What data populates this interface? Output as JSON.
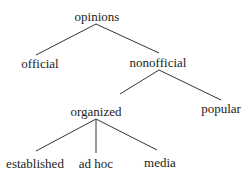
{
  "diagram": {
    "type": "tree",
    "colors": {
      "text": "#222222",
      "edge": "#333333",
      "background": "#ffffff"
    },
    "nodes": [
      {
        "id": "opinions",
        "label": "opinions",
        "x": 97,
        "y": 10
      },
      {
        "id": "official",
        "label": "official",
        "x": 40,
        "y": 57
      },
      {
        "id": "nonofficial",
        "label": "nonofficial",
        "x": 158,
        "y": 56
      },
      {
        "id": "organized",
        "label": "organized",
        "x": 96,
        "y": 105
      },
      {
        "id": "popular",
        "label": "popular",
        "x": 221,
        "y": 102
      },
      {
        "id": "established",
        "label": "established",
        "x": 35,
        "y": 157
      },
      {
        "id": "adhoc",
        "label": "ad hoc",
        "x": 96,
        "y": 157
      },
      {
        "id": "media",
        "label": "media",
        "x": 160,
        "y": 156
      }
    ],
    "edges": [
      {
        "from": "opinions",
        "to": "official",
        "x1": 96,
        "y1": 24,
        "x2": 36,
        "y2": 55
      },
      {
        "from": "opinions",
        "to": "nonofficial",
        "x1": 96,
        "y1": 24,
        "x2": 159,
        "y2": 53
      },
      {
        "from": "nonofficial",
        "to": "organized",
        "x1": 159,
        "y1": 70,
        "x2": 120,
        "y2": 94
      },
      {
        "from": "nonofficial",
        "to": "popular",
        "x1": 159,
        "y1": 70,
        "x2": 221,
        "y2": 100
      },
      {
        "from": "organized",
        "to": "established",
        "x1": 96,
        "y1": 119,
        "x2": 36,
        "y2": 151
      },
      {
        "from": "organized",
        "to": "adhoc",
        "x1": 96,
        "y1": 119,
        "x2": 96,
        "y2": 153
      },
      {
        "from": "organized",
        "to": "media",
        "x1": 96,
        "y1": 119,
        "x2": 157,
        "y2": 150
      }
    ]
  }
}
